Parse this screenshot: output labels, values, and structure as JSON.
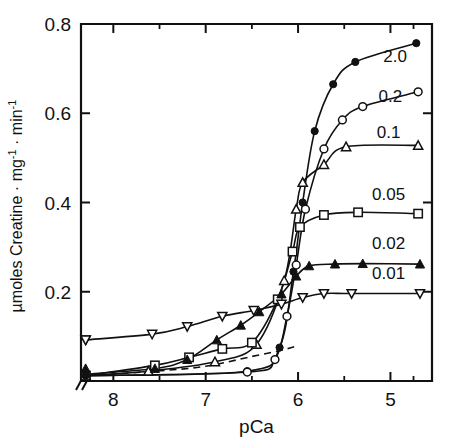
{
  "chart_data": {
    "type": "line",
    "title": "",
    "xlabel": "pCa",
    "ylabel": "µmoles Creatine · mg⁻¹ · min⁻¹",
    "xlim": [
      8.35,
      4.55
    ],
    "ylim": [
      0.0,
      0.8
    ],
    "x_ticks": [
      "8",
      "7",
      "6",
      "5"
    ],
    "x_tick_values": [
      8,
      7,
      6,
      5
    ],
    "x_minor_tick_values": [
      7.5,
      6.5,
      5.5,
      4.75
    ],
    "y_ticks": [
      "0.2",
      "0.4",
      "0.6",
      "0.8"
    ],
    "y_tick_values": [
      0.2,
      0.4,
      0.6,
      0.8
    ],
    "y_minor_tick_values": [
      0.1,
      0.3,
      0.5,
      0.7
    ],
    "x_axis_break": true,
    "x_axis_break_label": "//",
    "grid": false,
    "legend_position": "inline-right-of-curves",
    "series": [
      {
        "name": "2.0",
        "label": "2.0",
        "marker": "filled-circle",
        "label_x": 4.95,
        "label_y": 0.715,
        "points": [
          {
            "x": 8.3,
            "y": 0.012
          },
          {
            "x": 6.55,
            "y": 0.022
          },
          {
            "x": 6.2,
            "y": 0.075
          },
          {
            "x": 6.05,
            "y": 0.245
          },
          {
            "x": 5.95,
            "y": 0.4
          },
          {
            "x": 5.82,
            "y": 0.56
          },
          {
            "x": 5.62,
            "y": 0.665
          },
          {
            "x": 5.38,
            "y": 0.715
          },
          {
            "x": 4.72,
            "y": 0.757
          }
        ]
      },
      {
        "name": "0.2",
        "label": "0.2",
        "marker": "open-circle",
        "label_x": 5.0,
        "label_y": 0.625,
        "points": [
          {
            "x": 8.3,
            "y": 0.012
          },
          {
            "x": 6.55,
            "y": 0.02
          },
          {
            "x": 6.25,
            "y": 0.048
          },
          {
            "x": 6.12,
            "y": 0.145
          },
          {
            "x": 6.02,
            "y": 0.26
          },
          {
            "x": 5.92,
            "y": 0.385
          },
          {
            "x": 5.72,
            "y": 0.52
          },
          {
            "x": 5.52,
            "y": 0.585
          },
          {
            "x": 5.3,
            "y": 0.615
          },
          {
            "x": 4.7,
            "y": 0.648
          }
        ]
      },
      {
        "name": "0.1",
        "label": "0.1",
        "marker": "open-triangle-up",
        "label_x": 5.02,
        "label_y": 0.545,
        "points": [
          {
            "x": 8.3,
            "y": 0.012
          },
          {
            "x": 7.62,
            "y": 0.022
          },
          {
            "x": 6.9,
            "y": 0.043
          },
          {
            "x": 6.45,
            "y": 0.082
          },
          {
            "x": 6.15,
            "y": 0.225
          },
          {
            "x": 6.02,
            "y": 0.385
          },
          {
            "x": 5.95,
            "y": 0.445
          },
          {
            "x": 5.72,
            "y": 0.485
          },
          {
            "x": 5.48,
            "y": 0.525
          },
          {
            "x": 4.7,
            "y": 0.528
          }
        ]
      },
      {
        "name": "0.05",
        "label": "0.05",
        "marker": "open-square",
        "label_x": 5.02,
        "label_y": 0.405,
        "points": [
          {
            "x": 8.3,
            "y": 0.012
          },
          {
            "x": 7.55,
            "y": 0.035
          },
          {
            "x": 7.18,
            "y": 0.053
          },
          {
            "x": 6.82,
            "y": 0.072
          },
          {
            "x": 6.5,
            "y": 0.086
          },
          {
            "x": 6.22,
            "y": 0.183
          },
          {
            "x": 6.06,
            "y": 0.29
          },
          {
            "x": 5.98,
            "y": 0.345
          },
          {
            "x": 5.72,
            "y": 0.372
          },
          {
            "x": 5.35,
            "y": 0.378
          },
          {
            "x": 4.7,
            "y": 0.375
          }
        ]
      },
      {
        "name": "0.02",
        "label": "0.02",
        "marker": "filled-triangle-up",
        "label_x": 5.02,
        "label_y": 0.295,
        "points": [
          {
            "x": 8.3,
            "y": 0.015
          },
          {
            "x": 7.55,
            "y": 0.028
          },
          {
            "x": 7.2,
            "y": 0.048
          },
          {
            "x": 6.88,
            "y": 0.092
          },
          {
            "x": 6.62,
            "y": 0.125
          },
          {
            "x": 6.42,
            "y": 0.155
          },
          {
            "x": 6.18,
            "y": 0.195
          },
          {
            "x": 6.02,
            "y": 0.235
          },
          {
            "x": 5.88,
            "y": 0.258
          },
          {
            "x": 5.6,
            "y": 0.262
          },
          {
            "x": 5.3,
            "y": 0.263
          },
          {
            "x": 4.68,
            "y": 0.262
          }
        ]
      },
      {
        "name": "0.01",
        "label": "0.01",
        "marker": "open-triangle-down",
        "label_x": 5.02,
        "label_y": 0.228,
        "points": [
          {
            "x": 8.3,
            "y": 0.092
          },
          {
            "x": 7.58,
            "y": 0.105
          },
          {
            "x": 7.2,
            "y": 0.122
          },
          {
            "x": 6.82,
            "y": 0.145
          },
          {
            "x": 6.48,
            "y": 0.158
          },
          {
            "x": 6.18,
            "y": 0.172
          },
          {
            "x": 5.95,
            "y": 0.187
          },
          {
            "x": 5.72,
            "y": 0.196
          },
          {
            "x": 5.42,
            "y": 0.196
          },
          {
            "x": 4.68,
            "y": 0.196
          }
        ]
      },
      {
        "name": "baseline-dashed",
        "label": "",
        "marker": "none",
        "dashed": true,
        "points": [
          {
            "x": 8.3,
            "y": 0.012
          },
          {
            "x": 7.55,
            "y": 0.022
          },
          {
            "x": 7.0,
            "y": 0.033
          },
          {
            "x": 6.5,
            "y": 0.055
          },
          {
            "x": 6.2,
            "y": 0.068
          },
          {
            "x": 6.02,
            "y": 0.078
          }
        ]
      }
    ],
    "axis_origin_markers": [
      {
        "marker": "open-square",
        "x": 8.3,
        "y": 0.012
      },
      {
        "marker": "filled-circle",
        "x": 8.3,
        "y": 0.012
      },
      {
        "marker": "filled-triangle-up",
        "x": 8.3,
        "y": 0.028
      },
      {
        "marker": "open-triangle-down",
        "x": 8.3,
        "y": 0.092
      }
    ]
  }
}
